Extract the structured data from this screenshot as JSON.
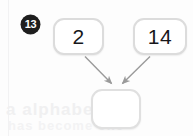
{
  "problem": {
    "number_badge": "13",
    "type": "number-bond-addition"
  },
  "boxes": {
    "addend_1": {
      "value": "2",
      "filled": true
    },
    "addend_2": {
      "value": "14",
      "filled": true
    },
    "answer": {
      "value": "",
      "placeholder": "",
      "filled": false
    }
  },
  "arrows": [
    {
      "name": "arrow-addend-1-to-answer",
      "from": "addend_1",
      "to": "answer"
    },
    {
      "name": "arrow-addend-2-to-answer",
      "from": "addend_2",
      "to": "answer"
    }
  ],
  "background": {
    "bleed_text_line_1": "a alphabet on",
    "bleed_text_line_2": "has become one"
  },
  "colors": {
    "badge_fill": "#1e1e1e",
    "badge_text": "#ffffff",
    "box_border": "#dcdcdc",
    "box_fill": "#ffffff",
    "digit_text": "#17171a",
    "arrow_stroke": "#9a9a9a",
    "page_background": "#fdfdfd"
  }
}
